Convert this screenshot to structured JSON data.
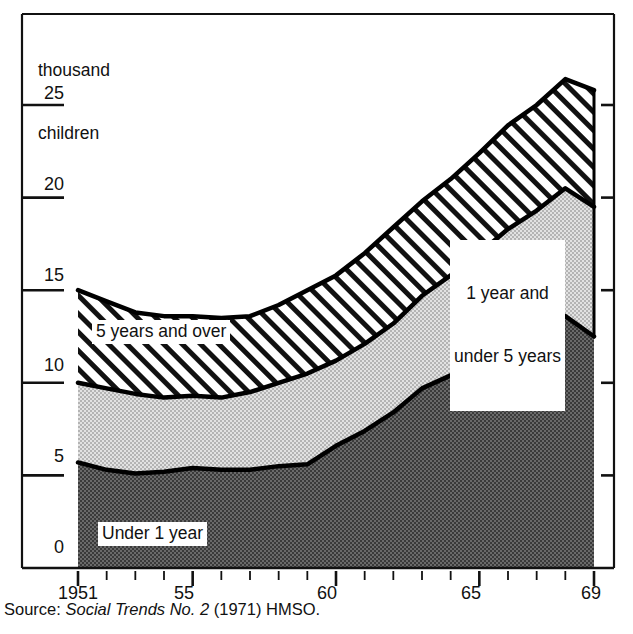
{
  "figure": {
    "source_prefix": "Source: ",
    "source_italic": "Social Trends No. 2",
    "source_suffix": " (1971) HMSO."
  },
  "chart_data": {
    "type": "area",
    "stacked": true,
    "title": "",
    "subtitle": "",
    "ylabel": "thousand\nchildren",
    "xlabel": "",
    "grid": false,
    "legend_position": "inside-plot",
    "ylim": [
      0,
      28
    ],
    "xlim": [
      1951,
      1969
    ],
    "y_ticks": [
      0,
      5,
      10,
      15,
      20,
      25
    ],
    "y_tick_labels": [
      "0",
      "5",
      "10",
      "15",
      "20",
      "25"
    ],
    "x_ticks": [
      1951,
      1952,
      1953,
      1954,
      1955,
      1956,
      1957,
      1958,
      1959,
      1960,
      1961,
      1962,
      1963,
      1964,
      1965,
      1966,
      1967,
      1968,
      1969
    ],
    "x_tick_labels": [
      "1951",
      "",
      "",
      "",
      "55",
      "",
      "",
      "",
      "",
      "60",
      "",
      "",
      "",
      "",
      "65",
      "",
      "",
      "",
      "69"
    ],
    "x_major_ticks": [
      1951,
      1955,
      1960,
      1965,
      1969
    ],
    "x": [
      1951,
      1952,
      1953,
      1954,
      1955,
      1956,
      1957,
      1958,
      1959,
      1960,
      1961,
      1962,
      1963,
      1964,
      1965,
      1966,
      1967,
      1968,
      1969
    ],
    "series": [
      {
        "name": "Under 1 year",
        "fill": "dark-stipple",
        "color": "#4a4a4a",
        "values": [
          5.7,
          5.3,
          5.1,
          5.2,
          5.4,
          5.3,
          5.3,
          5.5,
          5.6,
          6.6,
          7.4,
          8.4,
          9.7,
          10.4,
          11.3,
          11.9,
          13.0,
          13.6,
          12.5
        ]
      },
      {
        "name": "1 year and under 5 years",
        "fill": "light-stipple",
        "color": "#c9c9c9",
        "values": [
          4.3,
          4.4,
          4.3,
          4.0,
          3.9,
          3.9,
          4.2,
          4.5,
          4.9,
          4.6,
          4.7,
          4.8,
          5.0,
          5.4,
          5.7,
          6.4,
          6.3,
          6.9,
          7.0
        ]
      },
      {
        "name": "5 years and over",
        "fill": "diagonal-hatch",
        "color": "#ffffff",
        "values": [
          5.0,
          4.7,
          4.4,
          4.4,
          4.3,
          4.3,
          4.1,
          4.2,
          4.5,
          4.6,
          4.9,
          5.2,
          5.1,
          5.2,
          5.4,
          5.6,
          5.7,
          5.9,
          6.3
        ]
      }
    ],
    "cumulative_totals": {
      "under_1": [
        5.7,
        5.3,
        5.1,
        5.2,
        5.4,
        5.3,
        5.3,
        5.5,
        5.6,
        6.6,
        7.4,
        8.4,
        9.7,
        10.4,
        11.3,
        11.9,
        13.0,
        13.6,
        12.5
      ],
      "under_5": [
        10.0,
        9.7,
        9.4,
        9.2,
        9.3,
        9.2,
        9.5,
        10.0,
        10.5,
        11.2,
        12.1,
        13.2,
        14.7,
        15.8,
        17.0,
        18.3,
        19.3,
        20.5,
        19.5
      ],
      "all_ages": [
        15.0,
        14.4,
        13.8,
        13.6,
        13.6,
        13.5,
        13.6,
        14.2,
        15.0,
        15.8,
        17.0,
        18.4,
        19.8,
        21.0,
        22.4,
        23.9,
        25.0,
        26.4,
        25.8
      ]
    },
    "annotations": [
      {
        "id": "label-5-over",
        "text": "5 years and over",
        "x": 1954.0,
        "y": 12.0
      },
      {
        "id": "label-1-to-5",
        "text": "1 year and\nunder 5 years",
        "x": 1965.0,
        "y": 17.0
      },
      {
        "id": "label-under-1",
        "text": "Under 1 year",
        "x": 1954.5,
        "y": 2.2
      }
    ]
  },
  "labels": {
    "y_axis_title_line1": "thousand",
    "y_axis_title_line2": "children",
    "series_5_over": "5 years and over",
    "series_1_to_5_line1": "1 year and",
    "series_1_to_5_line2": "under 5 years",
    "series_under_1": "Under 1 year"
  },
  "ticks": {
    "y": [
      "25",
      "20",
      "15",
      "10",
      "5",
      "0"
    ],
    "x": [
      "1951",
      "55",
      "60",
      "65",
      "69"
    ]
  },
  "colors": {
    "under_1_fill": "#585858",
    "one_to_five_fill": "#c6c6c6",
    "five_over_fill": "#ffffff",
    "line": "#000000",
    "background": "#ffffff"
  }
}
